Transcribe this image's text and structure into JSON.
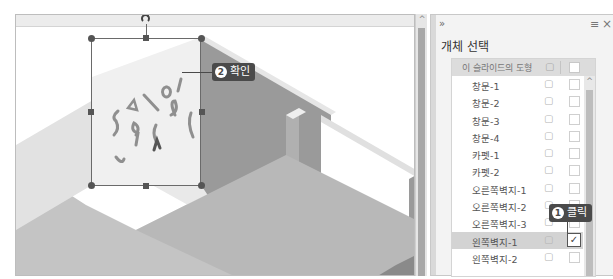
{
  "canvas": {
    "callout_confirm": {
      "number": "2",
      "label": "확인"
    },
    "scroll_up_glyph": "^"
  },
  "pane": {
    "expand_glyph": "»",
    "menu_glyph": "≡",
    "close_glyph": "×",
    "title": "개체 선택",
    "list_header": {
      "label": "이 슬라이드의 도형",
      "lock_glyph": "🔓"
    },
    "scroll_up_glyph": "^",
    "rows": [
      {
        "name": "창문-1",
        "checked": false,
        "selected": false
      },
      {
        "name": "창문-2",
        "checked": false,
        "selected": false
      },
      {
        "name": "창문-3",
        "checked": false,
        "selected": false
      },
      {
        "name": "창문-4",
        "checked": false,
        "selected": false
      },
      {
        "name": "카펫-1",
        "checked": false,
        "selected": false
      },
      {
        "name": "카펫-2",
        "checked": false,
        "selected": false
      },
      {
        "name": "오른쪽벽지-1",
        "checked": false,
        "selected": false
      },
      {
        "name": "오른쪽벽지-2",
        "checked": false,
        "selected": false
      },
      {
        "name": "오른쪽벽지-3",
        "checked": false,
        "selected": false
      },
      {
        "name": "왼쪽벽지-1",
        "checked": true,
        "selected": true
      },
      {
        "name": "왼쪽벽지-2",
        "checked": false,
        "selected": false
      }
    ],
    "lock_glyph": "🔓",
    "check_glyph": "✓",
    "callout_click": {
      "number": "1",
      "label": "클릭"
    }
  },
  "colors": {
    "callout_bg": "#4a4a4a",
    "selected_row_bg": "#d3d3d3",
    "wall_dark": "#9c9c9c",
    "floor": "#b8b8b8"
  }
}
